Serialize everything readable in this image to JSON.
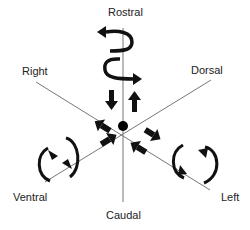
{
  "diagram": {
    "type": "anatomical-axes",
    "labels": {
      "rostral": "Rostral",
      "caudal": "Caudal",
      "right": "Right",
      "left": "Left",
      "dorsal": "Dorsal",
      "ventral": "Ventral"
    },
    "colors": {
      "axis_line": "#777777",
      "arrow": "#111111",
      "center": "#000000",
      "text": "#222222"
    }
  }
}
